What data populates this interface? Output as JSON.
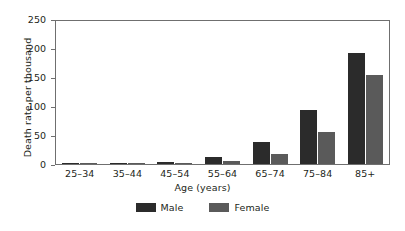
{
  "chart_data": {
    "type": "bar",
    "title": "",
    "xlabel": "Age (years)",
    "ylabel": "Death rate per thousand",
    "categories": [
      "25–34",
      "35–44",
      "45–54",
      "55–64",
      "65–74",
      "75–84",
      "85+"
    ],
    "series": [
      {
        "name": "Male",
        "color": "#2b2b2b",
        "values": [
          0.4,
          1,
          3,
          12,
          38,
          95,
          194
        ]
      },
      {
        "name": "Female",
        "color": "#5a5a5a",
        "values": [
          0.3,
          0.6,
          1.5,
          5,
          18,
          56,
          155
        ]
      }
    ],
    "ylim": [
      0,
      250
    ],
    "yticks": [
      "0",
      "50",
      "100",
      "150",
      "200",
      "250"
    ],
    "ytick_values": [
      0,
      50,
      100,
      150,
      200,
      250
    ],
    "grid": false,
    "legend_position": "bottom"
  }
}
